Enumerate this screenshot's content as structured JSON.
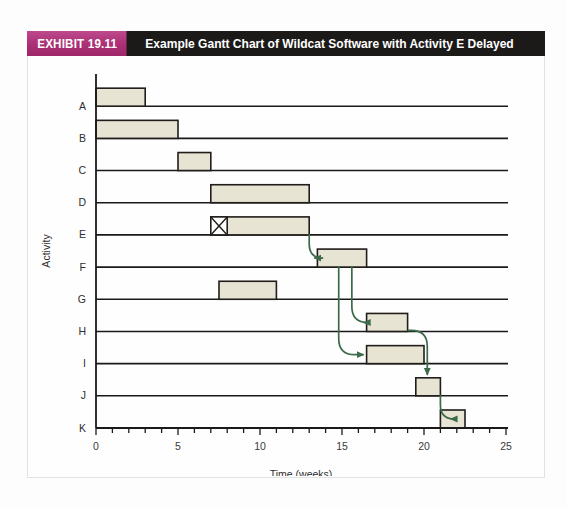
{
  "exhibit": {
    "tag": "EXHIBIT 19.11",
    "title": "Example Gantt Chart of Wildcat Software with Activity E Delayed"
  },
  "colors": {
    "tag_background": "#ab2f74",
    "title_background": "#1c1a18",
    "title_text": "#ffffff",
    "bar_fill": "#e8e4d4",
    "bar_border": "#201d1a",
    "arrow": "#3c6b4a",
    "gridline": "#1a1a1a",
    "axis": "#1a1a1a",
    "frame_border": "#e2e2e4"
  },
  "chart_data": {
    "type": "bar",
    "orientation": "horizontal",
    "title": "Example Gantt Chart of Wildcat Software with Activity E Delayed",
    "xlabel": "Time (weeks)",
    "ylabel": "Activity",
    "xlim": [
      0,
      25
    ],
    "ylim_categories": [
      "A",
      "B",
      "C",
      "D",
      "E",
      "F",
      "G",
      "H",
      "I",
      "J",
      "K"
    ],
    "x_major_ticks": [
      0,
      5,
      10,
      15,
      20,
      25
    ],
    "x_major_tick_labels": [
      "0",
      "5",
      "10",
      "15",
      "20",
      "25"
    ],
    "x_minor_tick_interval": 1,
    "grid": true,
    "grid_axis": "y",
    "legend": null,
    "categories": [
      "A",
      "B",
      "C",
      "D",
      "E",
      "F",
      "G",
      "H",
      "I",
      "J",
      "K"
    ],
    "tasks": [
      {
        "activity": "A",
        "start": 0,
        "end": 3,
        "duration": 3
      },
      {
        "activity": "B",
        "start": 0,
        "end": 5,
        "duration": 5
      },
      {
        "activity": "C",
        "start": 5,
        "end": 7,
        "duration": 2
      },
      {
        "activity": "D",
        "start": 7,
        "end": 13,
        "duration": 6
      },
      {
        "activity": "E",
        "start": 7,
        "end": 13,
        "duration": 6,
        "delay_marker": {
          "start": 7,
          "end": 8,
          "symbol": "x-box"
        }
      },
      {
        "activity": "F",
        "start": 13.5,
        "end": 16.5,
        "duration": 3
      },
      {
        "activity": "G",
        "start": 7.5,
        "end": 11,
        "duration": 3.5
      },
      {
        "activity": "H",
        "start": 16.5,
        "end": 19,
        "duration": 2.5
      },
      {
        "activity": "I",
        "start": 16.5,
        "end": 20,
        "duration": 3.5
      },
      {
        "activity": "J",
        "start": 19.5,
        "end": 21,
        "duration": 1.5
      },
      {
        "activity": "K",
        "start": 21,
        "end": 22.5,
        "duration": 1.5
      }
    ],
    "dependency_arrows": [
      {
        "from": "E",
        "to": "F",
        "from_time": 13,
        "to_time": 13.5
      },
      {
        "from": "F",
        "to": "H",
        "from_time": 15.6,
        "to_time": 16.5
      },
      {
        "from": "F",
        "to": "I",
        "from_time": 14.8,
        "to_time": 16.5
      },
      {
        "from": "H",
        "to": "J",
        "from_time": 19,
        "to_time": 20.2
      },
      {
        "from": "J",
        "to": "K",
        "from_time": 21,
        "to_time": 21.8
      }
    ],
    "values": [
      3,
      5,
      2,
      6,
      6,
      3,
      3.5,
      2.5,
      3.5,
      1.5,
      1.5
    ]
  }
}
